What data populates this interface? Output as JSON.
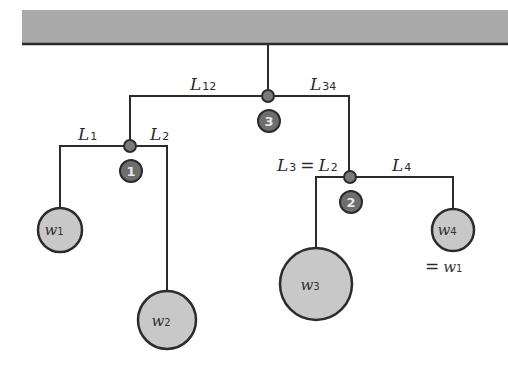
{
  "diagram": {
    "colors": {
      "ceiling": "#a9a9a9",
      "line": "#2b2b2b",
      "joint": "#7a7a7a",
      "label_circle": "#6e6e6e",
      "weight_fill": "#c8c8c8"
    },
    "arms": [
      {
        "id": "L12",
        "label_main": "L",
        "label_sub": "12"
      },
      {
        "id": "L34",
        "label_main": "L",
        "label_sub": "34"
      },
      {
        "id": "L1",
        "label_main": "L",
        "label_sub": "1"
      },
      {
        "id": "L2",
        "label_main": "L",
        "label_sub": "2"
      },
      {
        "id": "L3eqL2",
        "label_main": "L",
        "label_sub": "3",
        "eq": "=",
        "label_main2": "L",
        "label_sub2": "2"
      },
      {
        "id": "L4",
        "label_main": "L",
        "label_sub": "4"
      }
    ],
    "pivots": [
      {
        "number": "1"
      },
      {
        "number": "2"
      },
      {
        "number": "3"
      }
    ],
    "weights": [
      {
        "id": "w1",
        "label_main": "w",
        "label_sub": "1"
      },
      {
        "id": "w2",
        "label_main": "w",
        "label_sub": "2"
      },
      {
        "id": "w3",
        "label_main": "w",
        "label_sub": "3"
      },
      {
        "id": "w4",
        "label_main": "w",
        "label_sub": "4",
        "note_eq": "=",
        "note_main": "w",
        "note_sub": "1"
      }
    ]
  }
}
